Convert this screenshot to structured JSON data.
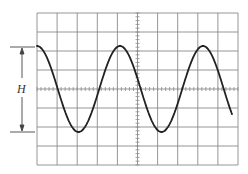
{
  "figure": {
    "type": "oscilloscope-trace",
    "label_H": "H",
    "grid": {
      "x0": 37,
      "y0": 13,
      "x1": 238,
      "y1": 165,
      "cols": 10,
      "rows": 8,
      "line_color": "#888888",
      "center_minor_ticks_per_div": 5
    },
    "waveform": {
      "shape": "sine",
      "peak_y": 46,
      "trough_y": 132,
      "center_y": 89,
      "start_x": 37,
      "end_x": 232,
      "period_px": 83,
      "phase": "starts at peak",
      "color": "#222222"
    },
    "measurement": {
      "name": "H",
      "description": "peak-to-peak height",
      "top_y": 47,
      "bottom_y": 132,
      "x": 22
    }
  }
}
